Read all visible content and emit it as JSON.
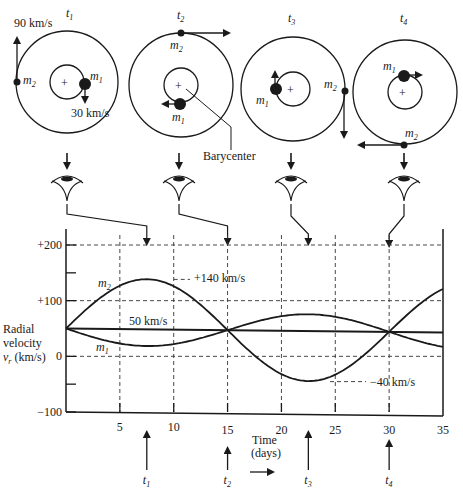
{
  "panels": [
    {
      "time_label": "t",
      "time_sub": "1",
      "m1_label": "m",
      "m1_sub": "1",
      "m2_label": "m",
      "m2_sub": "2",
      "m2_speed": "90 km/s",
      "m1_speed": "30 km/s"
    },
    {
      "time_label": "t",
      "time_sub": "2",
      "m1_label": "m",
      "m1_sub": "1",
      "m2_label": "m",
      "m2_sub": "2",
      "barycenter": "Barycenter"
    },
    {
      "time_label": "t",
      "time_sub": "3",
      "m1_label": "m",
      "m1_sub": "1",
      "m2_label": "m",
      "m2_sub": "2"
    },
    {
      "time_label": "t",
      "time_sub": "4",
      "m1_label": "m",
      "m1_sub": "1",
      "m2_label": "m",
      "m2_sub": "2"
    }
  ],
  "chart_data": {
    "type": "line",
    "title": "",
    "xlabel": "Time (days)",
    "ylabel_lines": [
      "Radial",
      "velocity",
      "v_r (km/s)"
    ],
    "ylabel_symbol": "v",
    "ylabel_sub": "r",
    "ylabel_unit": " (km/s)",
    "xlim": [
      0,
      35
    ],
    "ylim": [
      -100,
      200
    ],
    "x_ticks": [
      5,
      10,
      15,
      20,
      25,
      30,
      35
    ],
    "x_tick_labels": [
      "5",
      "10",
      "15",
      "20",
      "25",
      "30",
      "35"
    ],
    "y_ticks": [
      200,
      100,
      0,
      -100
    ],
    "y_tick_labels": [
      "+200",
      "+100",
      "0",
      "−100"
    ],
    "grid": true,
    "period_days": 30,
    "systemic_velocity": 50,
    "series": [
      {
        "name": "m2",
        "label": "m",
        "sub": "2",
        "amplitude": 90,
        "peak_value": 140,
        "phase_day_of_max": 7.5
      },
      {
        "name": "m1",
        "label": "m",
        "sub": "1",
        "amplitude": 30,
        "min_value": 20,
        "phase_day_of_min": 7.5
      },
      {
        "name": "systemic",
        "label": "50 km/s",
        "value": 50
      }
    ],
    "annotations": [
      {
        "text": "+140 km/s",
        "x": 7.5,
        "y": 140
      },
      {
        "text": "50 km/s",
        "x": 10,
        "y": 50
      },
      {
        "text": "−40 km/s",
        "x": 22.5,
        "y": -40
      }
    ],
    "time_markers": [
      {
        "label": "t",
        "sub": "1",
        "day": 7.5
      },
      {
        "label": "t",
        "sub": "2",
        "day": 15
      },
      {
        "label": "t",
        "sub": "3",
        "day": 22.5
      },
      {
        "label": "t",
        "sub": "4",
        "day": 30
      }
    ]
  },
  "time_caption": [
    "Time",
    "(days)"
  ]
}
